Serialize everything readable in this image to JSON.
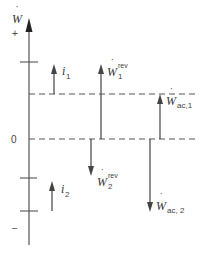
{
  "diagram": {
    "axis": {
      "label": "W",
      "label_dot": "˙",
      "plus_label": "+",
      "minus_label": "−",
      "zero_label": "0"
    },
    "levels": {
      "upper_dashed": "level 1",
      "zero_dashed": "0"
    },
    "arrows": [
      {
        "id": "i1",
        "base": "i",
        "sub": "1",
        "sup": "",
        "direction": "up"
      },
      {
        "id": "i2",
        "base": "i",
        "sub": "2",
        "sup": "",
        "direction": "up"
      },
      {
        "id": "w1rev",
        "base": "W",
        "sub": "1",
        "sup": "rev",
        "direction": "up"
      },
      {
        "id": "w2rev",
        "base": "W",
        "sub": "2",
        "sup": "rev",
        "direction": "down"
      },
      {
        "id": "wac1",
        "base": "W",
        "sub": "ac,1",
        "sup": "",
        "direction": "up"
      },
      {
        "id": "wac2",
        "base": "W",
        "sub": "ac, 2",
        "sup": "",
        "direction": "down"
      }
    ],
    "colors": {
      "line": "#555555",
      "arrow": "#444444",
      "text": "#333333"
    }
  }
}
